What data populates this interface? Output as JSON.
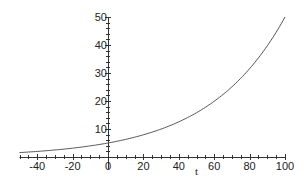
{
  "chart_data": {
    "type": "line",
    "title": "",
    "xlabel": "t",
    "ylabel": "",
    "xlim": [
      -50,
      100
    ],
    "ylim": [
      0,
      50
    ],
    "grid": false,
    "legend": null,
    "x_ticks": [
      -40,
      -20,
      0,
      20,
      40,
      60,
      80,
      100
    ],
    "x_tick_labels": [
      "-40",
      "-20",
      "0",
      "20",
      "40",
      "60",
      "80",
      "100"
    ],
    "y_ticks": [
      10,
      20,
      30,
      40,
      50
    ],
    "y_tick_labels": [
      "10",
      "20",
      "30",
      "40",
      "50"
    ],
    "series": [
      {
        "name": "curve",
        "function": "5*10^(t/100)",
        "x": [
          -50,
          -40,
          -30,
          -20,
          -10,
          0,
          10,
          20,
          30,
          40,
          50,
          60,
          70,
          80,
          90,
          100
        ],
        "values": [
          1.58,
          1.99,
          2.51,
          3.15,
          3.97,
          5.0,
          6.29,
          7.92,
          9.98,
          12.56,
          15.81,
          19.91,
          25.06,
          31.55,
          39.72,
          50.0
        ]
      }
    ],
    "colors": {
      "curve": "#555555",
      "axes": "#333333"
    }
  }
}
